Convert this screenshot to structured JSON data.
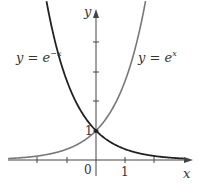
{
  "chart_data": {
    "type": "line",
    "title": "",
    "xlabel": "x",
    "ylabel": "y",
    "xlim": [
      -3.0,
      3.4
    ],
    "ylim": [
      -0.5,
      5.2
    ],
    "grid": false,
    "x_ticks": [
      -2,
      -1,
      1,
      2
    ],
    "y_ticks": [
      1,
      2,
      3,
      4
    ],
    "tick_labels": {
      "origin": "0",
      "x_one": "1",
      "y_one": "1"
    },
    "series": [
      {
        "name": "y = e^{-x}",
        "label_text": "y = e",
        "label_exp": "−x",
        "function": "exp(-x)",
        "color": "#222222",
        "x": [
          -1.7,
          -1,
          0,
          1,
          2,
          3
        ],
        "y": [
          5.47,
          2.72,
          1,
          0.37,
          0.14,
          0.05
        ]
      },
      {
        "name": "y = e^{x}",
        "label_text": "y = e",
        "label_exp": "x",
        "function": "exp(x)",
        "color": "#777777",
        "x": [
          -3,
          -2,
          -1,
          0,
          1,
          1.7
        ],
        "y": [
          0.05,
          0.14,
          0.37,
          1,
          2.72,
          5.47
        ]
      }
    ],
    "annotations": [
      {
        "text": "y = e^{-x}",
        "position": "upper-left"
      },
      {
        "text": "y = e^{x}",
        "position": "upper-right"
      },
      {
        "text": "intersection (0, 1)",
        "marker": "dot"
      }
    ]
  },
  "axes": {
    "x_label": "x",
    "y_label": "y",
    "origin_label": "0",
    "x_tick_label": "1",
    "y_tick_label": "1"
  },
  "labels": {
    "left_curve_base": "y = e",
    "left_curve_exp": "−x",
    "right_curve_base": "y = e",
    "right_curve_exp": "x"
  }
}
